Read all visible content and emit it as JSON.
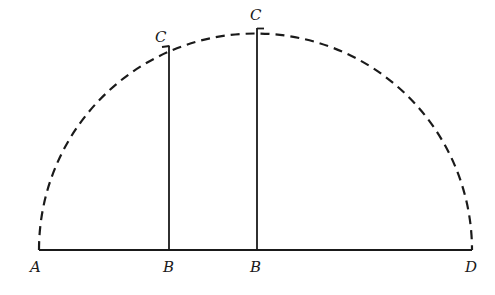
{
  "diagram": {
    "type": "semicircle-construction",
    "stroke_color": "#1a1a1a",
    "background": "#ffffff",
    "baseline": {
      "from": "A",
      "to": "D",
      "y": 250,
      "x1": 39,
      "x2": 472
    },
    "arc": {
      "style": "dashed",
      "cx": 255.5,
      "cy": 250,
      "r": 216.5
    },
    "perpendiculars": [
      {
        "foot": "B",
        "top": "C",
        "x": 169,
        "y_top": 46
      },
      {
        "foot": "B",
        "top": "C",
        "x": 257,
        "y_top": 28
      }
    ],
    "labels": {
      "A": "A",
      "B1": "B",
      "B2": "B",
      "D": "D",
      "C1": "C",
      "C2": "C"
    }
  }
}
